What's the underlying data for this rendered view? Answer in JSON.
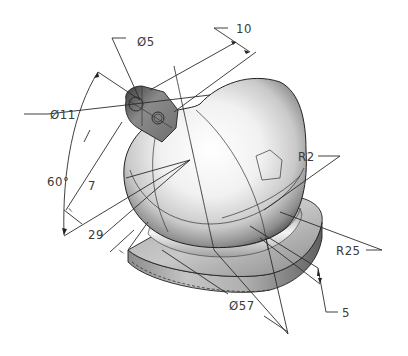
{
  "drawing": {
    "title": "Ball knob with base flange and side lug — isometric dimensioned view",
    "dimensions": {
      "hole_small_dia": "Ø5",
      "lug_outer_dia": "Ø11",
      "offset_10": "10",
      "angle": "60°",
      "length_7": "7",
      "length_29": "29",
      "fillet_r2": "R2",
      "radius_r25": "R25",
      "base_dia": "Ø57",
      "base_thickness": "5"
    },
    "colors": {
      "background": "#ffffff",
      "line": "#222222",
      "text": "#3a3a3a",
      "shade_light": "#f4f4f4",
      "shade_mid": "#b8b8b8",
      "shade_dark": "#5a5a5a"
    }
  }
}
